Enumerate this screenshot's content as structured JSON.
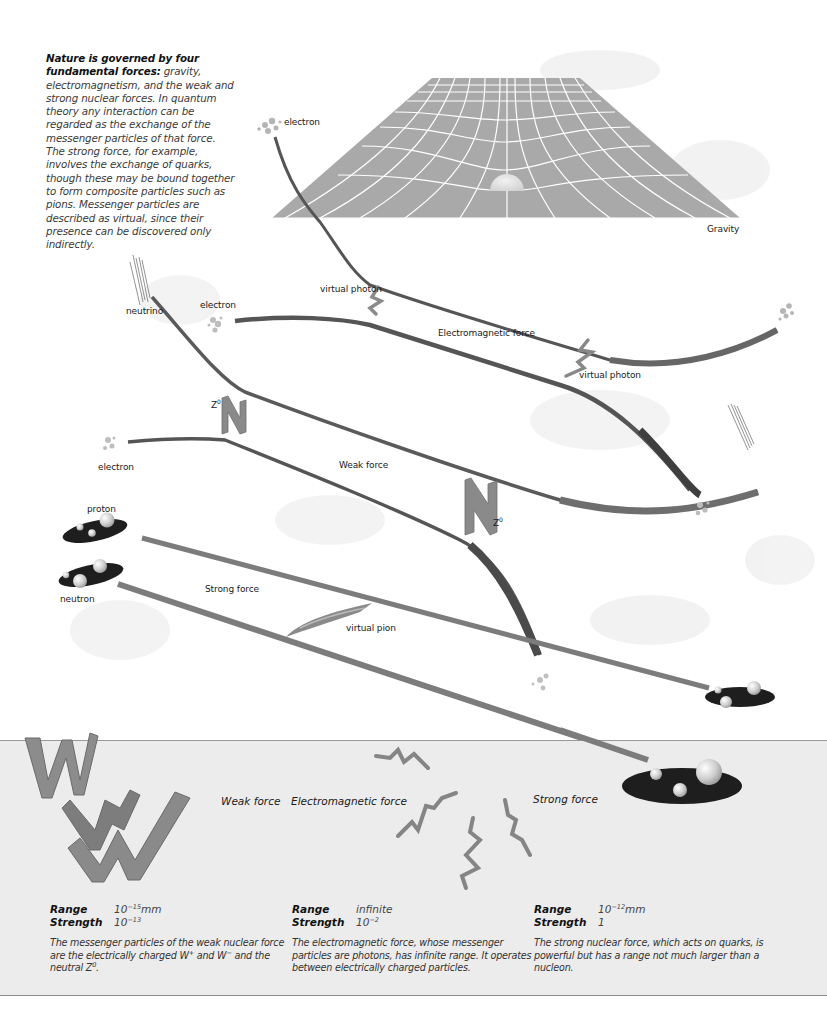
{
  "intro": {
    "lead": "Nature is governed by four fundamental forces:",
    "body": " gravity, electromagnetism, and the weak and strong nuclear forces. In quantum theory any interaction can be regarded as the exchange of the messenger particles of that force. The strong force, for example, involves the exchange of quarks, though these may be bound together to form composite particles such as pions. Messenger particles are described as virtual, since their presence can be discovered only indirectly."
  },
  "diagram": {
    "gravity": {
      "label": "Gravity",
      "particle": "electron"
    },
    "electromagnetic": {
      "label": "Electromagnetic force",
      "particle_left": "electron",
      "messenger_top": "virtual photon",
      "messenger_bottom": "virtual photon"
    },
    "weak": {
      "label": "Weak force",
      "particle_top": "neutrino",
      "particle_bottom": "electron",
      "messenger_left": "Z",
      "messenger_left_sup": "0",
      "messenger_right": "Z",
      "messenger_right_sup": "0"
    },
    "strong": {
      "label": "Strong force",
      "particle_top": "proton",
      "particle_bottom": "neutron",
      "messenger": "virtual pion"
    },
    "colors": {
      "grid_fill": "#a9a9a9",
      "grid_lines": "#ffffff",
      "track_dark": "#555555",
      "track_mid": "#7a7a7a",
      "nucleus": "#1e1e1e",
      "panel_bg": "#ececec"
    }
  },
  "panel": {
    "weak": {
      "title": "Weak force",
      "range_label": "Range",
      "range_value": "10",
      "range_exp": "−15",
      "range_unit": "mm",
      "strength_label": "Strength",
      "strength_value": "10",
      "strength_exp": "−13",
      "desc_a": "The messenger particles of the weak nuclear force are the electrically charged W",
      "desc_sup1": "+",
      "desc_b": " and W",
      "desc_sup2": "−",
      "desc_c": " and the neutral Z",
      "desc_sup3": "0",
      "desc_d": "."
    },
    "electromagnetic": {
      "title": "Electromagnetic force",
      "range_label": "Range",
      "range_value": "infinite",
      "strength_label": "Strength",
      "strength_value": "10",
      "strength_exp": "−2",
      "desc": "The electromagnetic force, whose messenger particles are photons, has infinite range. It operates between electrically charged particles."
    },
    "strong": {
      "title": "Strong force",
      "range_label": "Range",
      "range_value": "10",
      "range_exp": "−12",
      "range_unit": "mm",
      "strength_label": "Strength",
      "strength_value": "1",
      "desc": "The strong nuclear force, which acts on quarks, is powerful but has a range not much larger than a nucleon."
    }
  }
}
